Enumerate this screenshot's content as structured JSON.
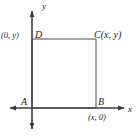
{
  "figure": {
    "type": "coordinate-geometry-diagram",
    "background_color": "#ffffff",
    "line_color": "#404040",
    "text_color": "#1a1a1a"
  },
  "axes": {
    "x_label": "x",
    "y_label": "y",
    "x_axis": {
      "from_x": 4,
      "to_x": 126,
      "y": 108,
      "arrow_left": true,
      "arrow_right": true
    },
    "y_axis": {
      "from_y": 133,
      "to_y": 6,
      "x": 32,
      "arrow_up": true,
      "arrow_down": true
    }
  },
  "shape": {
    "name": "rectangle",
    "left": 32,
    "right": 96,
    "top": 39,
    "bottom": 108
  },
  "vertices": [
    {
      "id": "A",
      "label": "A",
      "coord_label": "",
      "x": 32,
      "y": 108
    },
    {
      "id": "B",
      "label": "B",
      "coord_label": "(x, 0)",
      "x": 96,
      "y": 108
    },
    {
      "id": "C",
      "label": "C(x, y)",
      "coord_label": "",
      "x": 96,
      "y": 39
    },
    {
      "id": "D",
      "label": "D",
      "coord_label": "(0, y)",
      "x": 32,
      "y": 39
    }
  ],
  "labels": {
    "vertex_a": "A",
    "vertex_b": "B",
    "vertex_c": "C(x, y)",
    "vertex_d": "D",
    "coord_d": "(0, y)",
    "coord_b": "(x, 0)",
    "axis_x": "x",
    "axis_y": "y"
  }
}
